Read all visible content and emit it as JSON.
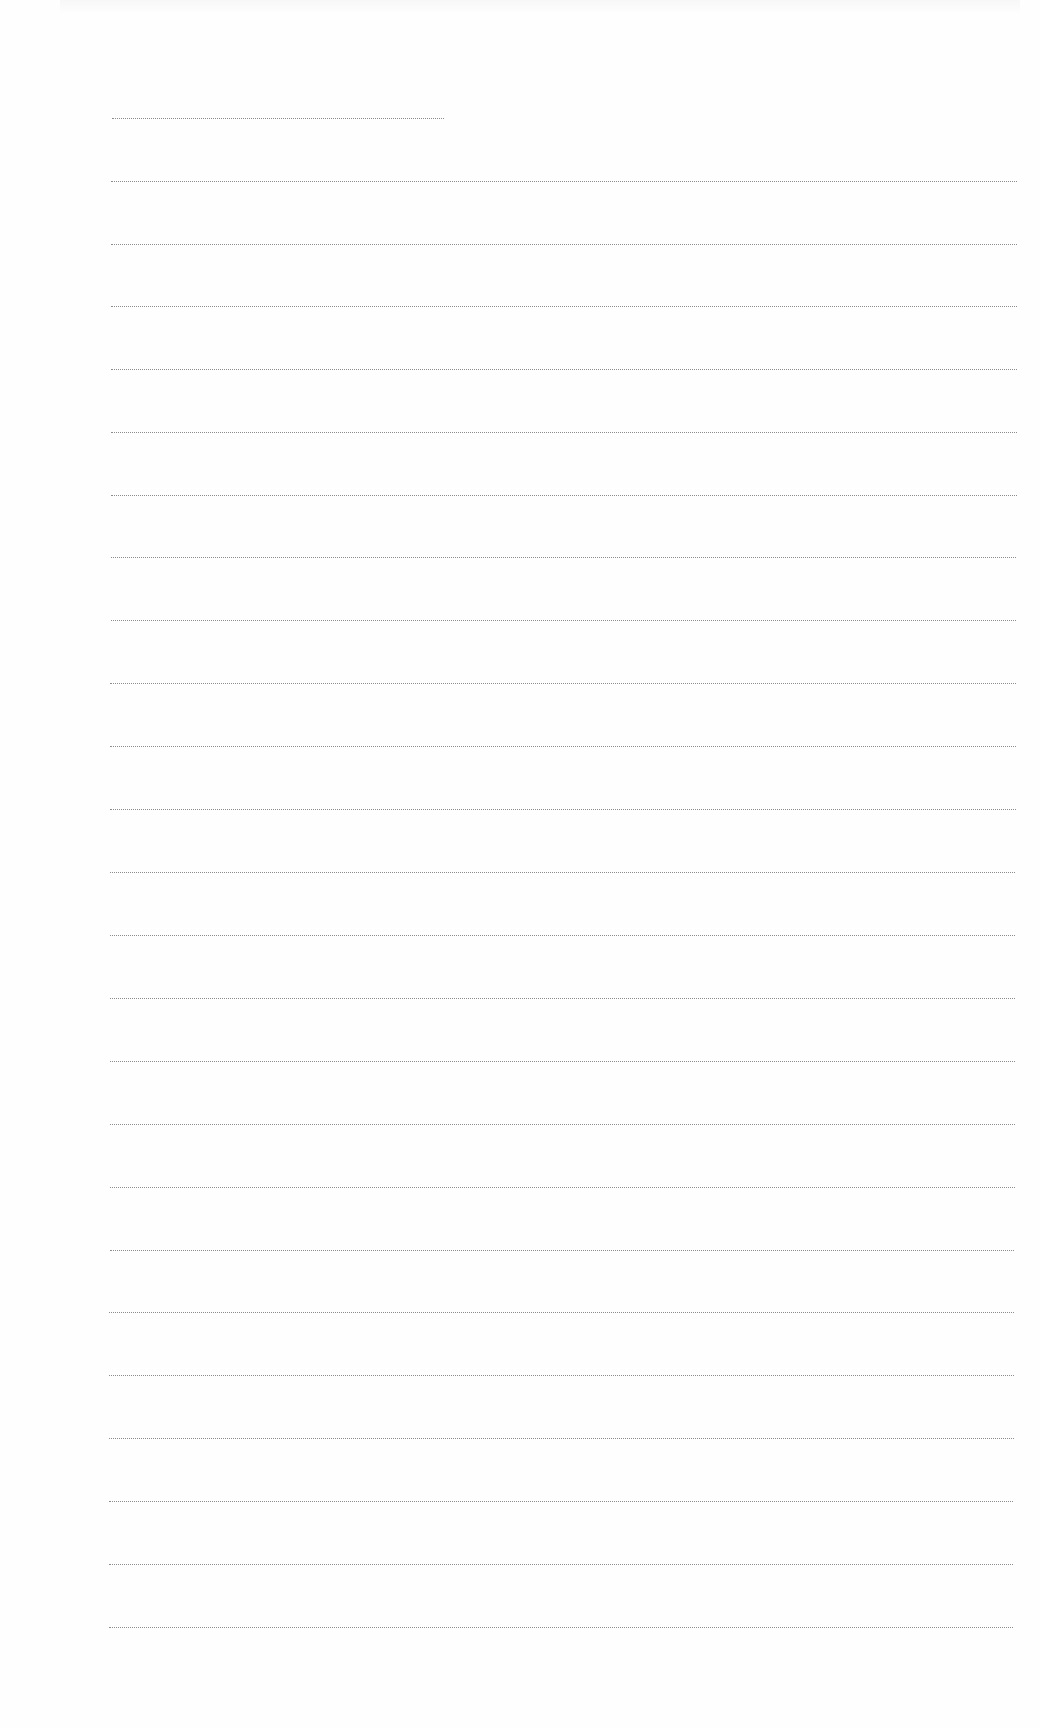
{
  "page": {
    "type": "lined-writing-sheet",
    "background_color": "#fefefe",
    "line_color": "#8c8c8c",
    "line_style": "dotted",
    "line_count": 25
  },
  "lines": [
    {
      "y": 118,
      "x1": 112,
      "x2": 444
    },
    {
      "y": 181,
      "x1": 111,
      "x2": 1017
    },
    {
      "y": 244,
      "x1": 111,
      "x2": 1017
    },
    {
      "y": 306,
      "x1": 111,
      "x2": 1017
    },
    {
      "y": 369,
      "x1": 111,
      "x2": 1017
    },
    {
      "y": 432,
      "x1": 111,
      "x2": 1017
    },
    {
      "y": 495,
      "x1": 111,
      "x2": 1017
    },
    {
      "y": 557,
      "x1": 111,
      "x2": 1016
    },
    {
      "y": 620,
      "x1": 111,
      "x2": 1016
    },
    {
      "y": 683,
      "x1": 110,
      "x2": 1016
    },
    {
      "y": 746,
      "x1": 110,
      "x2": 1016
    },
    {
      "y": 809,
      "x1": 110,
      "x2": 1016
    },
    {
      "y": 872,
      "x1": 110,
      "x2": 1015
    },
    {
      "y": 935,
      "x1": 110,
      "x2": 1015
    },
    {
      "y": 998,
      "x1": 110,
      "x2": 1015
    },
    {
      "y": 1061,
      "x1": 110,
      "x2": 1015
    },
    {
      "y": 1124,
      "x1": 110,
      "x2": 1015
    },
    {
      "y": 1187,
      "x1": 110,
      "x2": 1015
    },
    {
      "y": 1250,
      "x1": 110,
      "x2": 1014
    },
    {
      "y": 1312,
      "x1": 109,
      "x2": 1014
    },
    {
      "y": 1375,
      "x1": 109,
      "x2": 1014
    },
    {
      "y": 1438,
      "x1": 109,
      "x2": 1014
    },
    {
      "y": 1501,
      "x1": 109,
      "x2": 1013
    },
    {
      "y": 1564,
      "x1": 109,
      "x2": 1013
    },
    {
      "y": 1627,
      "x1": 109,
      "x2": 1013
    }
  ]
}
